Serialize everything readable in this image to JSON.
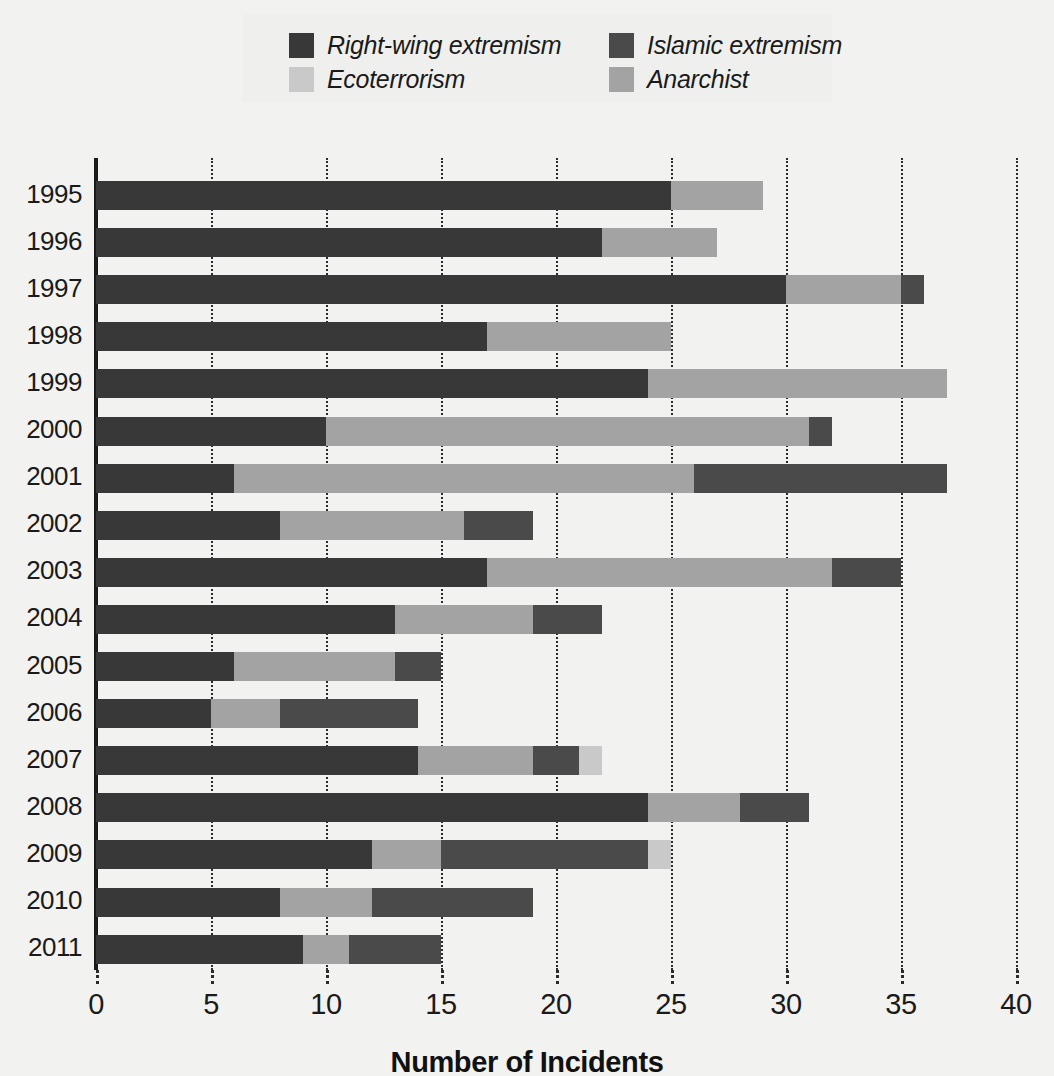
{
  "chart_data": {
    "type": "bar",
    "orientation": "horizontal",
    "stacked": true,
    "title": "",
    "xlabel": "Number of Incidents",
    "ylabel": "",
    "xlim": [
      0,
      40
    ],
    "xticks": [
      0,
      5,
      10,
      15,
      20,
      25,
      30,
      35,
      40
    ],
    "xtick_labels": [
      "0",
      "5",
      "10",
      "15",
      "20",
      "25",
      "30",
      "35",
      "40"
    ],
    "grid": "vertical-dotted",
    "legend_position": "top-center",
    "categories": [
      "1995",
      "1996",
      "1997",
      "1998",
      "1999",
      "2000",
      "2001",
      "2002",
      "2003",
      "2004",
      "2005",
      "2006",
      "2007",
      "2008",
      "2009",
      "2010",
      "2011"
    ],
    "series": [
      {
        "name": "Right-wing extremism",
        "color": "#383838",
        "values": [
          25,
          22,
          30,
          17,
          24,
          10,
          6,
          8,
          17,
          13,
          6,
          5,
          14,
          24,
          12,
          8,
          9
        ]
      },
      {
        "name": "Anarchist",
        "color": "#a3a3a3",
        "values": [
          4,
          5,
          5,
          8,
          13,
          21,
          20,
          8,
          15,
          6,
          7,
          3,
          5,
          4,
          3,
          4,
          2
        ]
      },
      {
        "name": "Islamic extremism",
        "color": "#4a4a4a",
        "values": [
          0,
          0,
          1,
          0,
          0,
          1,
          11,
          3,
          3,
          3,
          2,
          6,
          2,
          3,
          9,
          7,
          4
        ]
      },
      {
        "name": "Ecoterrorism",
        "color": "#c9c9c9",
        "values": [
          0,
          0,
          0,
          0,
          0,
          0,
          0,
          0,
          0,
          0,
          0,
          0,
          1,
          0,
          1,
          0,
          0
        ]
      }
    ],
    "totals": [
      29,
      27,
      36,
      25,
      37,
      32,
      37,
      19,
      35,
      22,
      15,
      14,
      22,
      31,
      25,
      19,
      15
    ],
    "stack_order": [
      "Right-wing extremism",
      "Anarchist",
      "Islamic extremism",
      "Ecoterrorism"
    ]
  },
  "legend": {
    "entries": [
      {
        "label": "Right-wing extremism",
        "color": "#383838",
        "swatch_name": "legend-swatch-right-wing"
      },
      {
        "label": "Islamic extremism",
        "color": "#4a4a4a",
        "swatch_name": "legend-swatch-islamic"
      },
      {
        "label": "Ecoterrorism",
        "color": "#c9c9c9",
        "swatch_name": "legend-swatch-ecoterrorism"
      },
      {
        "label": "Anarchist",
        "color": "#a3a3a3",
        "swatch_name": "legend-swatch-anarchist"
      }
    ]
  },
  "colors": {
    "background": "#f2f2f0",
    "legend_background": "#efefed",
    "axis": "#1a1a1a",
    "gridline": "#2b2b2b",
    "right_wing": "#383838",
    "islamic": "#4a4a4a",
    "ecoterrorism": "#c9c9c9",
    "anarchist": "#a3a3a3"
  }
}
